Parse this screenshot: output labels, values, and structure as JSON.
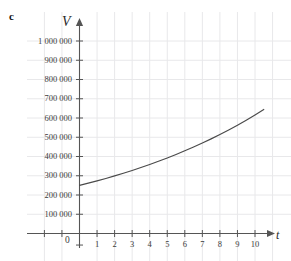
{
  "figure": {
    "part_label": "c"
  },
  "chart_data": {
    "type": "line",
    "title": "",
    "xlabel": "t",
    "ylabel": "V",
    "xlim": [
      -2.2,
      11.5
    ],
    "ylim": [
      -90000,
      1080000
    ],
    "grid": true,
    "legend": null,
    "x_ticks": [
      0,
      1,
      2,
      3,
      4,
      5,
      6,
      7,
      8,
      9,
      10
    ],
    "x_tick_labels": [
      "0",
      "1",
      "2",
      "3",
      "4",
      "5",
      "6",
      "7",
      "8",
      "9",
      "10"
    ],
    "y_ticks": [
      100000,
      200000,
      300000,
      400000,
      500000,
      600000,
      700000,
      800000,
      900000,
      1000000
    ],
    "y_tick_labels": [
      "100 000",
      "200 000",
      "300 000",
      "400 000",
      "500 000",
      "600 000",
      "700 000",
      "800 000",
      "900 000",
      "1 000 000"
    ],
    "series": [
      {
        "name": "V",
        "curve_color": "#4a4a4a",
        "x": [
          0,
          0.5,
          1,
          1.5,
          2,
          2.5,
          3,
          3.5,
          4,
          4.5,
          5,
          5.5,
          6,
          6.5,
          7,
          7.5,
          8,
          8.5,
          9,
          9.5,
          10,
          10.5
        ],
        "values": [
          250000,
          261500,
          273500,
          286100,
          299300,
          313100,
          327600,
          342700,
          358500,
          375000,
          392400,
          410500,
          429400,
          449200,
          470000,
          491600,
          514300,
          538000,
          562800,
          588800,
          616000,
          644400
        ]
      }
    ],
    "colors": {
      "grid": "#e8e8ea",
      "axis": "#555555",
      "curve": "#4a4a4a",
      "tick_text": "#3a3a3a"
    }
  }
}
